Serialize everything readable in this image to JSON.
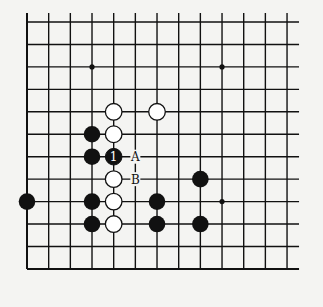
{
  "board": {
    "cols": 13,
    "rows": 12,
    "origin_x": 27,
    "origin_y": 22,
    "spacing_x": 21.67,
    "spacing_y": 22.45,
    "line_color": "#111111",
    "background": "#f4f4f2",
    "star_points": [
      [
        3,
        2
      ],
      [
        9,
        2
      ],
      [
        9,
        8
      ]
    ]
  },
  "stones": {
    "white": [
      [
        4,
        4
      ],
      [
        6,
        4
      ],
      [
        4,
        5
      ],
      [
        4,
        7
      ],
      [
        4,
        8
      ],
      [
        4,
        9
      ]
    ],
    "black": [
      [
        3,
        5
      ],
      [
        3,
        6
      ],
      [
        8,
        7
      ],
      [
        0,
        8
      ],
      [
        3,
        8
      ],
      [
        6,
        8
      ],
      [
        3,
        9
      ],
      [
        6,
        9
      ],
      [
        8,
        9
      ]
    ],
    "numbered": [
      {
        "col": 4,
        "row": 6,
        "color": "black",
        "label": "1"
      }
    ]
  },
  "labels": [
    {
      "col": 5,
      "row": 6,
      "text": "A"
    },
    {
      "col": 5,
      "row": 7,
      "text": "B"
    }
  ]
}
